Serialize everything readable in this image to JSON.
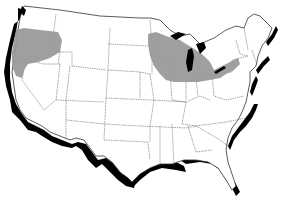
{
  "map": {
    "title": "",
    "type": "outline map of contiguous United States with state borders",
    "colors": {
      "background": "#ffffff",
      "state_border": "#555555",
      "coast_shadow": "#000000",
      "shaded_region": "#9a9a9a",
      "great_lakes": "#000000"
    },
    "shaded_regions": [
      {
        "name": "pacific-northwest",
        "states": [
          "Washington",
          "Oregon"
        ]
      },
      {
        "name": "upper-midwest-great-lakes",
        "states": [
          "Minnesota",
          "Wisconsin",
          "Michigan",
          "Iowa",
          "Illinois",
          "Indiana",
          "Ohio",
          "Pennsylvania"
        ]
      }
    ]
  }
}
